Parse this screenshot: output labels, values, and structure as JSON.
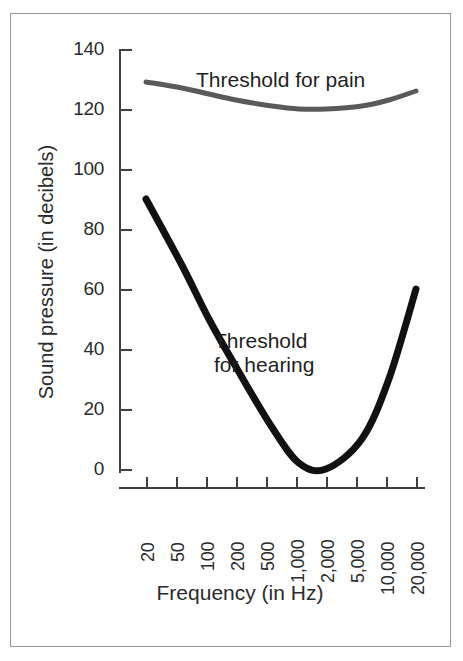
{
  "chart_data": {
    "type": "line",
    "title": "",
    "xlabel": "Frequency (in Hz)",
    "ylabel": "Sound pressure (in decibels)",
    "xscale": "log",
    "x_tick_labels": [
      "20",
      "50",
      "100",
      "200",
      "500",
      "1,000",
      "2,000",
      "5,000",
      "10,000",
      "20,000"
    ],
    "x_tick_values": [
      20,
      50,
      100,
      200,
      500,
      1000,
      2000,
      5000,
      10000,
      20000
    ],
    "y_tick_labels": [
      "140",
      "120",
      "100",
      "80",
      "60",
      "40",
      "20",
      "0"
    ],
    "y_tick_values": [
      140,
      120,
      100,
      80,
      60,
      40,
      20,
      0
    ],
    "ylim": [
      0,
      140
    ],
    "grid": false,
    "legend": "inline-annotations",
    "series": [
      {
        "name": "Threshold for pain",
        "color": "#5a5a5a",
        "linewidth": 5,
        "x": [
          20,
          50,
          100,
          200,
          500,
          1000,
          2000,
          5000,
          10000,
          20000
        ],
        "values": [
          129,
          127,
          125,
          123,
          121,
          120,
          120,
          121,
          123,
          126
        ]
      },
      {
        "name": "Threshold for hearing",
        "color": "#111111",
        "linewidth": 7,
        "x": [
          20,
          50,
          100,
          200,
          500,
          1000,
          2000,
          5000,
          10000,
          20000
        ],
        "values": [
          90,
          68,
          50,
          34,
          14,
          2,
          0,
          10,
          30,
          60
        ]
      }
    ],
    "annotations": [
      {
        "text": "Threshold for pain",
        "x": 200,
        "y": 133
      },
      {
        "text": "Threshold\nfor hearing",
        "x": 900,
        "y": 42
      }
    ]
  },
  "axes": {
    "y_title": "Sound pressure (in decibels)",
    "x_title": "Frequency (in Hz)",
    "y_ticks": [
      {
        "label": "140"
      },
      {
        "label": "120"
      },
      {
        "label": "100"
      },
      {
        "label": "80"
      },
      {
        "label": "60"
      },
      {
        "label": "40"
      },
      {
        "label": "20"
      },
      {
        "label": "0"
      }
    ],
    "x_ticks": [
      {
        "label": "20"
      },
      {
        "label": "50"
      },
      {
        "label": "100"
      },
      {
        "label": "200"
      },
      {
        "label": "500"
      },
      {
        "label": "1,000"
      },
      {
        "label": "2,000"
      },
      {
        "label": "5,000"
      },
      {
        "label": "10,000"
      },
      {
        "label": "20,000"
      }
    ]
  },
  "labels": {
    "pain_curve": "Threshold for pain",
    "hearing_curve_line1": "Threshold",
    "hearing_curve_line2": "for hearing"
  },
  "colors": {
    "pain_curve": "#5a5a5a",
    "hearing_curve": "#111111",
    "axis": "#404040",
    "frame": "#9a9a9a",
    "text": "#2b2b2b",
    "background": "#ffffff"
  }
}
